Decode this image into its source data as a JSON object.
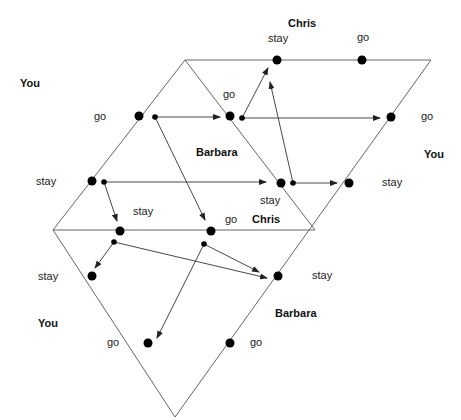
{
  "diagram": {
    "type": "extensive-form game diagram",
    "players": [
      "You",
      "Barbara",
      "Chris"
    ],
    "labels": {
      "chris_top": "Chris",
      "chris_top_stay": "stay",
      "chris_top_go": "go",
      "you_top": "You",
      "you_go_left": "go",
      "you_stay_left": "stay",
      "barbara_mid": "Barbara",
      "barbara_go_mid": "go",
      "you_go_right": "go",
      "you_right": "You",
      "you_stay_right": "stay",
      "barbara_stay_mid": "stay",
      "chris_lower_stay": "stay",
      "chris_lower_go": "go",
      "chris_lower": "Chris",
      "you_stay_bottom": "stay",
      "you_bottom": "You",
      "you_go_bottom": "go",
      "barbara_stay_bottom": "stay",
      "barbara_bottom": "Barbara",
      "barbara_go_bottom": "go"
    },
    "colors": {
      "line": "#555555",
      "node": "#000000",
      "text": "#222222"
    }
  }
}
